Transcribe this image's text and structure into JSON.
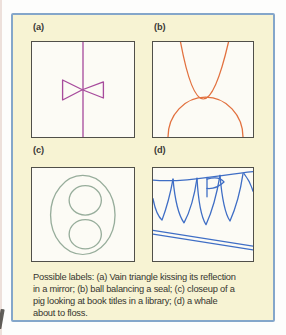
{
  "figure": {
    "background_color": "#f7f3d3",
    "border_color": "#84a6ca",
    "panel_background": "#fcfbf5",
    "panel_border_color": "#504f49",
    "label_color": "#3a3936",
    "caption_color": "#36352f",
    "panels": [
      {
        "label": "(a)",
        "stroke_color": "#a74b9c",
        "drawing": "bowtie-triangles-on-mirror-line"
      },
      {
        "label": "(b)",
        "stroke_color": "#e2713f",
        "drawing": "parabola-balanced-on-dome"
      },
      {
        "label": "(c)",
        "stroke_color": "#97ad9b",
        "drawing": "oval-with-two-circles"
      },
      {
        "label": "(d)",
        "stroke_color": "#3f6ec5",
        "drawing": "hanging-teeth-with-floss-lines"
      }
    ],
    "caption_lines": [
      "Possible labels: (a) Vain triangle kissing its reflection",
      "in a mirror; (b) ball balancing a seal; (c) closeup of a",
      "pig looking at book titles in a library; (d) a whale",
      "about to floss."
    ]
  }
}
